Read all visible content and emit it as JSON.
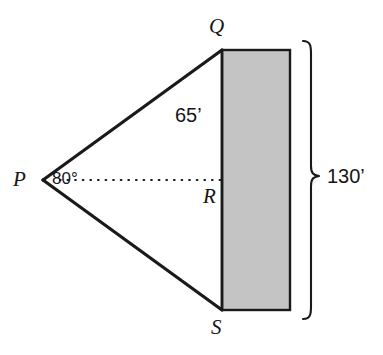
{
  "figure": {
    "type": "geometry-diagram",
    "background_color": "#ffffff",
    "stroke_color": "#1a1a1a",
    "rectangle_fill_color": "#c4c4c4",
    "vertices": {
      "P": {
        "label": "P",
        "x": 42,
        "y": 180
      },
      "Q": {
        "label": "Q",
        "x": 222,
        "y": 50
      },
      "R": {
        "label": "R",
        "x": 222,
        "y": 180
      },
      "S": {
        "label": "S",
        "x": 222,
        "y": 310
      }
    },
    "angle": {
      "label": "80°",
      "value": 80,
      "unit": "degrees",
      "at_vertex": "P"
    },
    "measurements": [
      {
        "label": "65’",
        "value": 65,
        "unit": "feet",
        "segment": "QR"
      },
      {
        "label": "130’",
        "value": 130,
        "unit": "feet",
        "segment": "QS"
      }
    ],
    "shaded_rectangle": {
      "left": 222,
      "top": 50,
      "right": 290,
      "bottom": 310
    },
    "brace": {
      "label": "130’",
      "top": 40,
      "bottom": 310,
      "x": 308
    }
  }
}
